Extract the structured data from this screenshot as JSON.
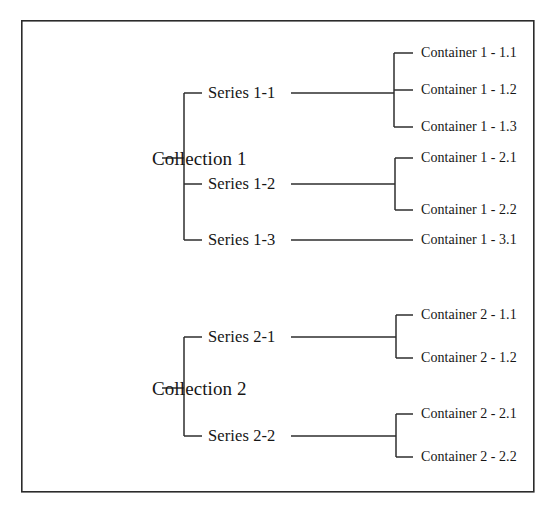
{
  "diagram": {
    "type": "tree-hierarchy",
    "title": "",
    "orientation": "left-to-right",
    "background_color": "#ffffff",
    "line_color": "#2e2e2e",
    "text_color": "#161616",
    "border": {
      "name": "outer-frame",
      "x": 21,
      "y": 20,
      "width": 512,
      "height": 471,
      "color": "#2b2b2b"
    },
    "roots": [
      {
        "id": "collection-1",
        "label": "Collection 1",
        "x": 152,
        "y": 158,
        "trunk_x": 184,
        "children": [
          {
            "id": "series-1-1",
            "label": "Series 1-1",
            "x": 208,
            "y": 93,
            "branch_x": 394,
            "children": [
              {
                "id": "container-1-1-1",
                "label": "Container 1 - 1.1",
                "x": 421,
                "y": 53
              },
              {
                "id": "container-1-1-2",
                "label": "Container 1 - 1.2",
                "x": 421,
                "y": 90
              },
              {
                "id": "container-1-1-3",
                "label": "Container 1 - 1.3",
                "x": 421,
                "y": 127
              }
            ]
          },
          {
            "id": "series-1-2",
            "label": "Series 1-2",
            "x": 208,
            "y": 184,
            "branch_x": 395,
            "children": [
              {
                "id": "container-1-2-1",
                "label": "Container 1 - 2.1",
                "x": 421,
                "y": 158
              },
              {
                "id": "container-1-2-2",
                "label": "Container 1 - 2.2",
                "x": 421,
                "y": 210
              }
            ]
          },
          {
            "id": "series-1-3",
            "label": "Series 1-3",
            "x": 208,
            "y": 240,
            "branch_x": 401,
            "children": [
              {
                "id": "container-1-3-1",
                "label": "Container 1 - 3.1",
                "x": 421,
                "y": 240
              }
            ]
          }
        ]
      },
      {
        "id": "collection-2",
        "label": "Collection 2",
        "x": 152,
        "y": 388,
        "trunk_x": 184,
        "children": [
          {
            "id": "series-2-1",
            "label": "Series 2-1",
            "x": 208,
            "y": 337,
            "branch_x": 396,
            "children": [
              {
                "id": "container-2-1-1",
                "label": "Container 2 - 1.1",
                "x": 421,
                "y": 315
              },
              {
                "id": "container-2-1-2",
                "label": "Container 2 - 1.2",
                "x": 421,
                "y": 358
              }
            ]
          },
          {
            "id": "series-2-2",
            "label": "Series 2-2",
            "x": 208,
            "y": 436,
            "branch_x": 396,
            "children": [
              {
                "id": "container-2-2-1",
                "label": "Container 2 - 2.1",
                "x": 421,
                "y": 414
              },
              {
                "id": "container-2-2-2",
                "label": "Container 2 - 2.2",
                "x": 421,
                "y": 457
              }
            ]
          }
        ]
      }
    ]
  }
}
